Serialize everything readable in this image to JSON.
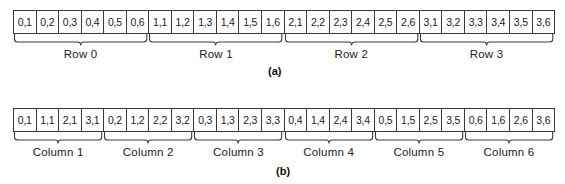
{
  "figure_a": {
    "caption": "(a)",
    "cells": [
      "0,1",
      "0,2",
      "0,3",
      "0,4",
      "0,5",
      "0,6",
      "1,1",
      "1,2",
      "1,3",
      "1,4",
      "1,5",
      "1,6",
      "2,1",
      "2,2",
      "2,3",
      "2,4",
      "2,5",
      "2,6",
      "3,1",
      "3,2",
      "3,3",
      "3,4",
      "3,5",
      "3,6"
    ],
    "groups": [
      {
        "label": "Row 0",
        "span": 6
      },
      {
        "label": "Row 1",
        "span": 6
      },
      {
        "label": "Row 2",
        "span": 6
      },
      {
        "label": "Row 3",
        "span": 6
      }
    ]
  },
  "figure_b": {
    "caption": "(b)",
    "cells": [
      "0,1",
      "1,1",
      "2,1",
      "3,1",
      "0,2",
      "1,2",
      "2,2",
      "3,2",
      "0,3",
      "1,3",
      "2,3",
      "3,3",
      "0,4",
      "1,4",
      "2,4",
      "3,4",
      "0,5",
      "1,5",
      "2,5",
      "3,5",
      "0,6",
      "1,6",
      "2,6",
      "3,6"
    ],
    "groups": [
      {
        "label": "Column 1",
        "span": 4
      },
      {
        "label": "Column 2",
        "span": 4
      },
      {
        "label": "Column 3",
        "span": 4
      },
      {
        "label": "Column 4",
        "span": 4
      },
      {
        "label": "Column 5",
        "span": 4
      },
      {
        "label": "Column 6",
        "span": 4
      }
    ]
  },
  "colors": {
    "line": "#3a3a3a",
    "text": "#222222",
    "background": "#ffffff"
  }
}
